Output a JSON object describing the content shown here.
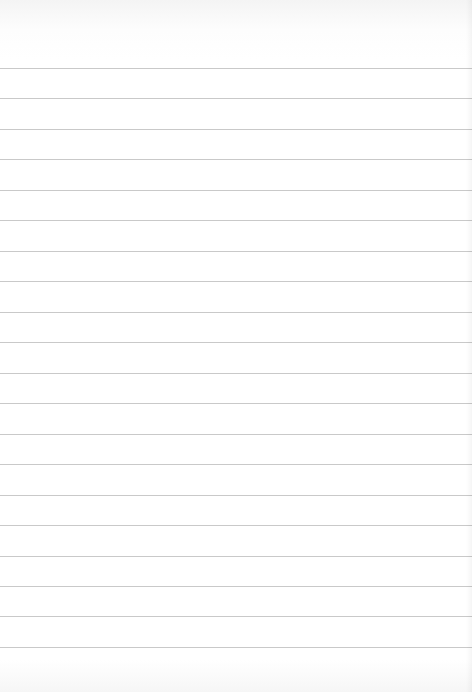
{
  "page": {
    "type": "blank-ruled-paper",
    "background_color": "#ffffff",
    "rule_color": "#c9c9c9",
    "rule_count": 20,
    "first_rule_y": 68,
    "rule_spacing": 30.47
  }
}
